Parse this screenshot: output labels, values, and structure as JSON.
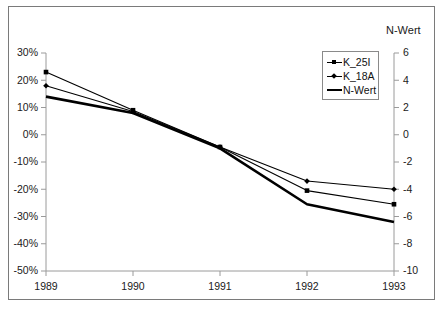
{
  "chart_data": {
    "type": "line",
    "title": "",
    "subtitle": "",
    "xlabel": "",
    "ylabel": "",
    "y2label": "N-Wert",
    "categories": [
      "1989",
      "1990",
      "1991",
      "1992",
      "1993"
    ],
    "x_tick_labels": [
      "1989",
      "1990",
      "1991",
      "1992",
      "1993"
    ],
    "y_tick_labels": [
      "30%",
      "20%",
      "10%",
      "0%",
      "-10%",
      "-20%",
      "-30%",
      "-40%",
      "-50%"
    ],
    "y_tick_values": [
      30,
      20,
      10,
      0,
      -10,
      -20,
      -30,
      -40,
      -50
    ],
    "ylim": [
      -50,
      30
    ],
    "y2_tick_labels": [
      "6",
      "4",
      "2",
      "0",
      "-2",
      "-4",
      "-6",
      "-8",
      "-10"
    ],
    "y2_tick_values": [
      6,
      4,
      2,
      0,
      -2,
      -4,
      -6,
      -8,
      -10
    ],
    "y2lim": [
      -10,
      6
    ],
    "grid": false,
    "legend_position": "top-right-inside",
    "series": [
      {
        "name": "K_25I",
        "axis": "left",
        "marker": "square",
        "line_width": "thin",
        "color": "#000000",
        "values": [
          23,
          9,
          -4.5,
          -20.5,
          -25.5
        ]
      },
      {
        "name": "K_18A",
        "axis": "left",
        "marker": "diamond",
        "line_width": "thin",
        "color": "#000000",
        "values": [
          18,
          8.5,
          -4.5,
          -17,
          -20
        ]
      },
      {
        "name": "N-Wert",
        "axis": "left",
        "marker": "none",
        "line_width": "thick",
        "color": "#000000",
        "values": [
          14,
          8,
          -5,
          -25.5,
          -32
        ]
      }
    ],
    "legend_entries": [
      "K_25I",
      "K_18A",
      "N-Wert"
    ],
    "annotations": []
  },
  "axis_titles": {
    "right_axis_title": "N-Wert"
  },
  "colors": {
    "line": "#000000",
    "axis": "#808080",
    "border": "#7a7a7a",
    "text": "#1a1a1a",
    "background": "#ffffff"
  }
}
